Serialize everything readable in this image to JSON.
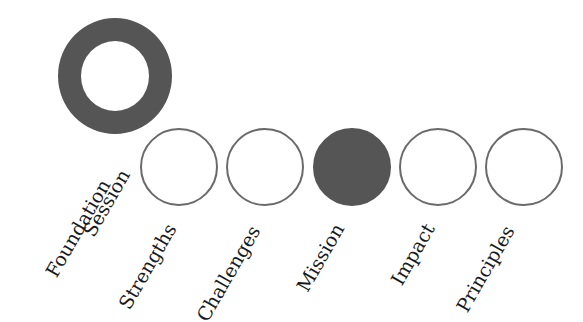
{
  "foundation": {
    "label_line1": "Foundation",
    "label_line2": "Session",
    "style": "ring",
    "color": "#555555"
  },
  "steps": [
    {
      "label": "Strengths",
      "filled": false
    },
    {
      "label": "Challenges",
      "filled": false
    },
    {
      "label": "Mission",
      "filled": true
    },
    {
      "label": "Impact",
      "filled": false
    },
    {
      "label": "Principles",
      "filled": false
    }
  ],
  "colors": {
    "fill": "#555555",
    "outline": "#6a6a6a",
    "text": "#1a1a1a"
  }
}
